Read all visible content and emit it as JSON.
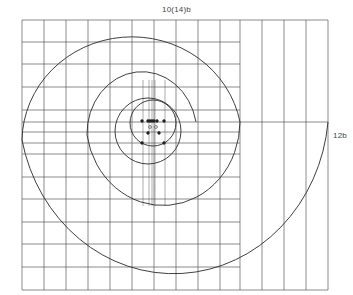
{
  "diagram": {
    "type": "spiral-on-grid",
    "labels": {
      "top": "10(14)b",
      "right": "12b"
    },
    "colors": {
      "line": "#2a2a2a",
      "grid": "#555555",
      "background": "#ffffff"
    },
    "grid": {
      "left": 22,
      "top": 20,
      "right": 328,
      "bottom": 290,
      "left_section_right": 240,
      "vertical_lines_x": [
        22,
        44,
        66,
        88,
        110,
        132,
        154,
        176,
        198,
        220,
        240,
        262,
        284,
        306,
        328
      ],
      "extra_center_vertical_lines_x": [
        143,
        149,
        152,
        155,
        165
      ],
      "horizontal_lines_y": [
        20,
        42,
        64,
        87,
        110,
        132,
        143,
        154,
        177,
        199,
        222,
        244,
        267,
        290
      ],
      "full_width_horizontal_lines_y": [
        20,
        122,
        290
      ]
    },
    "spiral_arcs": [
      {
        "name": "outer-lower-arc",
        "from": [
          328,
          122
        ],
        "via": [
          165,
          290
        ],
        "to": [
          22,
          140
        ]
      },
      {
        "name": "outer-upper-arc",
        "from": [
          22,
          140
        ],
        "via": [
          140,
          20
        ],
        "to": [
          240,
          122
        ]
      },
      {
        "name": "middle-lower-arc",
        "from": [
          240,
          122
        ],
        "via": [
          158,
          206
        ],
        "to": [
          87,
          135
        ]
      },
      {
        "name": "middle-upper-arc",
        "from": [
          87,
          135
        ],
        "via": [
          155,
          70
        ],
        "to": [
          196,
          122
        ]
      }
    ],
    "inner_circles": [
      {
        "name": "inner-circle-large",
        "cx": 148,
        "cy": 131,
        "r": 33
      },
      {
        "name": "inner-circle-small",
        "cx": 153,
        "cy": 123,
        "r": 23
      }
    ],
    "points": {
      "filled": [
        [
          142,
          121
        ],
        [
          148,
          121
        ],
        [
          150,
          121
        ],
        [
          152,
          121
        ],
        [
          154,
          121
        ],
        [
          157,
          121
        ],
        [
          164,
          121
        ],
        [
          148,
          133
        ],
        [
          159,
          133
        ],
        [
          142,
          143
        ],
        [
          164,
          143
        ]
      ],
      "open": [
        [
          150,
          127
        ],
        [
          156,
          127
        ]
      ]
    }
  }
}
